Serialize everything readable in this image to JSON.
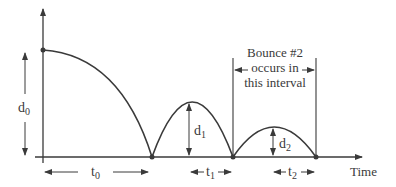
{
  "diagram": {
    "labels": {
      "d0": "d",
      "d0_sub": "0",
      "d1": "d",
      "d1_sub": "1",
      "d2": "d",
      "d2_sub": "2",
      "t0": "t",
      "t0_sub": "0",
      "t1": "t",
      "t1_sub": "1",
      "t2": "t",
      "t2_sub": "2",
      "x_axis": "Time"
    },
    "annotation": {
      "line1": "Bounce #2",
      "line2": "occurs in",
      "line3": "this interval"
    },
    "colors": {
      "stroke": "#3a3a3a",
      "background": "#ffffff"
    }
  }
}
